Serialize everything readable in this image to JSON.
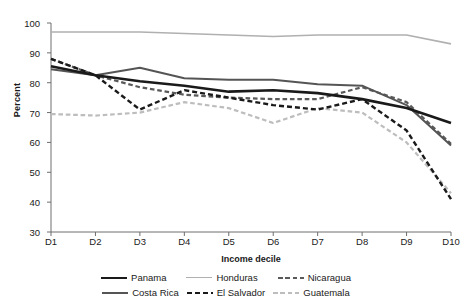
{
  "chart_data": {
    "type": "line",
    "title": "",
    "xlabel": "Income decile",
    "ylabel": "Percent",
    "categories": [
      "D1",
      "D2",
      "D3",
      "D4",
      "D5",
      "D6",
      "D7",
      "D8",
      "D9",
      "D10"
    ],
    "ylim": [
      30,
      100
    ],
    "yticks": [
      30,
      40,
      50,
      60,
      70,
      80,
      90,
      100
    ],
    "grid": false,
    "legend_position": "bottom",
    "series": [
      {
        "name": "Panama",
        "color": "#1a1a1a",
        "style": "solid",
        "width": 2.6,
        "values": [
          85.5,
          82.5,
          80.5,
          79.0,
          77.0,
          77.5,
          76.5,
          74.5,
          71.5,
          66.5
        ]
      },
      {
        "name": "Costa Rica",
        "color": "#555555",
        "style": "solid",
        "width": 2.0,
        "values": [
          84.5,
          82.5,
          85.0,
          81.5,
          81.0,
          81.0,
          79.5,
          79.0,
          72.5,
          59.0
        ]
      },
      {
        "name": "Honduras",
        "color": "#b0b0b0",
        "style": "solid",
        "width": 1.6,
        "values": [
          97.0,
          97.0,
          97.0,
          96.5,
          96.0,
          95.5,
          96.0,
          96.0,
          96.0,
          93.0
        ]
      },
      {
        "name": "Nicaragua",
        "color": "#5a5a5a",
        "style": "dashed",
        "width": 2.2,
        "values": [
          88.0,
          82.5,
          78.5,
          76.0,
          75.0,
          74.5,
          74.5,
          78.5,
          73.5,
          59.5
        ]
      },
      {
        "name": "El Salvador",
        "color": "#1a1a1a",
        "style": "dashed",
        "width": 2.4,
        "values": [
          88.0,
          82.5,
          71.0,
          77.5,
          75.0,
          72.5,
          71.0,
          74.5,
          64.0,
          41.0
        ]
      },
      {
        "name": "Guatemala",
        "color": "#bdbdbd",
        "style": "dashed",
        "width": 2.2,
        "values": [
          69.5,
          69.0,
          70.0,
          73.5,
          71.5,
          66.5,
          71.5,
          70.0,
          60.0,
          43.0
        ]
      }
    ]
  },
  "axis": {
    "y_ticks": [
      "30",
      "40",
      "50",
      "60",
      "70",
      "80",
      "90",
      "100"
    ],
    "x_ticks": [
      "D1",
      "D2",
      "D3",
      "D4",
      "D5",
      "D6",
      "D7",
      "D8",
      "D9",
      "D10"
    ],
    "y_title": "Percent",
    "x_title": "Income decile"
  },
  "legend": {
    "row1": [
      "Panama",
      "Honduras",
      "Nicaragua"
    ],
    "row2": [
      "Costa Rica",
      "El Salvador",
      "Guatemala"
    ]
  }
}
